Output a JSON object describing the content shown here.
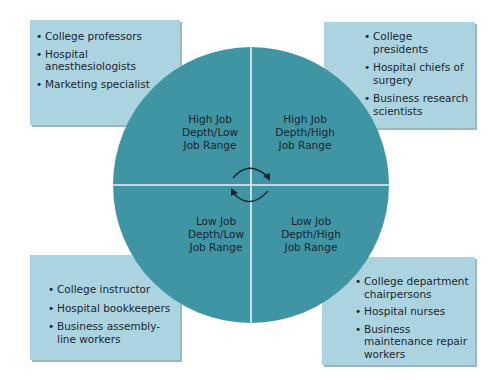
{
  "diagram": {
    "type": "quadrant-circle",
    "colors": {
      "circle_fill": "#3f95a4",
      "divider": "#e6f2f4",
      "box_fill": "#acd4e0",
      "arrow": "#15252f",
      "text": "#1b2631"
    },
    "quadrants": {
      "top_left": {
        "label_lines": [
          "High Job",
          "Depth/Low",
          "Job Range"
        ],
        "examples": [
          "College professors",
          "Hospital anesthesiologists",
          "Marketing specialist"
        ]
      },
      "top_right": {
        "label_lines": [
          "High Job",
          "Depth/High",
          "Job Range"
        ],
        "examples": [
          "College presidents",
          "Hospital chiefs of surgery",
          "Business research scientists"
        ]
      },
      "bottom_left": {
        "label_lines": [
          "Low Job",
          "Depth/Low",
          "Job Range"
        ],
        "examples": [
          "College instructor",
          "Hospital bookkeepers",
          "Business assembly-line workers"
        ]
      },
      "bottom_right": {
        "label_lines": [
          "Low Job",
          "Depth/High",
          "Job Range"
        ],
        "examples": [
          "College department chairpersons",
          "Hospital nurses",
          "Business maintenance repair workers"
        ]
      }
    },
    "center_icon": "cycle-arrows-icon"
  }
}
